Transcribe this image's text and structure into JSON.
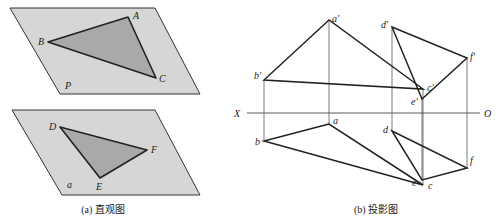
{
  "figure_a": {
    "caption": "(a) 直观图",
    "plane_P": {
      "label": "P",
      "vertices": [
        [
          10,
          8
        ],
        [
          155,
          8
        ],
        [
          200,
          94
        ],
        [
          60,
          94
        ]
      ],
      "triangle": {
        "A": {
          "label": "A",
          "pos": [
            128,
            17
          ]
        },
        "B": {
          "label": "B",
          "pos": [
            48,
            42
          ]
        },
        "C": {
          "label": "C",
          "pos": [
            156,
            78
          ]
        }
      }
    },
    "plane_a": {
      "label": "a",
      "vertices": [
        [
          12,
          110
        ],
        [
          155,
          110
        ],
        [
          200,
          195
        ],
        [
          62,
          195
        ]
      ],
      "triangle": {
        "D": {
          "label": "D",
          "pos": [
            60,
            127
          ]
        },
        "E": {
          "label": "E",
          "pos": [
            100,
            178
          ]
        },
        "F": {
          "label": "F",
          "pos": [
            147,
            150
          ]
        }
      }
    }
  },
  "figure_b": {
    "caption": "(b) 投影图",
    "axis": {
      "x_label": "X",
      "o_label": "O",
      "y": 113,
      "x_start": 247,
      "x_end": 480
    },
    "abc": {
      "a_prime": {
        "label": "a'",
        "pos": [
          329,
          20
        ]
      },
      "b_prime": {
        "label": "b'",
        "pos": [
          264,
          80
        ]
      },
      "c_prime": {
        "label": "c'",
        "pos": [
          423,
          89
        ]
      },
      "a": {
        "label": "a",
        "pos": [
          329,
          124
        ]
      },
      "b": {
        "label": "b",
        "pos": [
          264,
          141
        ]
      },
      "c": {
        "label": "c",
        "pos": [
          423,
          185
        ]
      }
    },
    "def": {
      "d_prime": {
        "label": "d'",
        "pos": [
          392,
          27
        ]
      },
      "e_prime": {
        "label": "e'",
        "pos": [
          422,
          99
        ]
      },
      "f_prime": {
        "label": "f'",
        "pos": [
          467,
          58
        ]
      },
      "d": {
        "label": "d",
        "pos": [
          392,
          131
        ]
      },
      "e": {
        "label": "e",
        "pos": [
          422,
          180
        ]
      },
      "f": {
        "label": "f",
        "pos": [
          467,
          168
        ]
      }
    }
  }
}
